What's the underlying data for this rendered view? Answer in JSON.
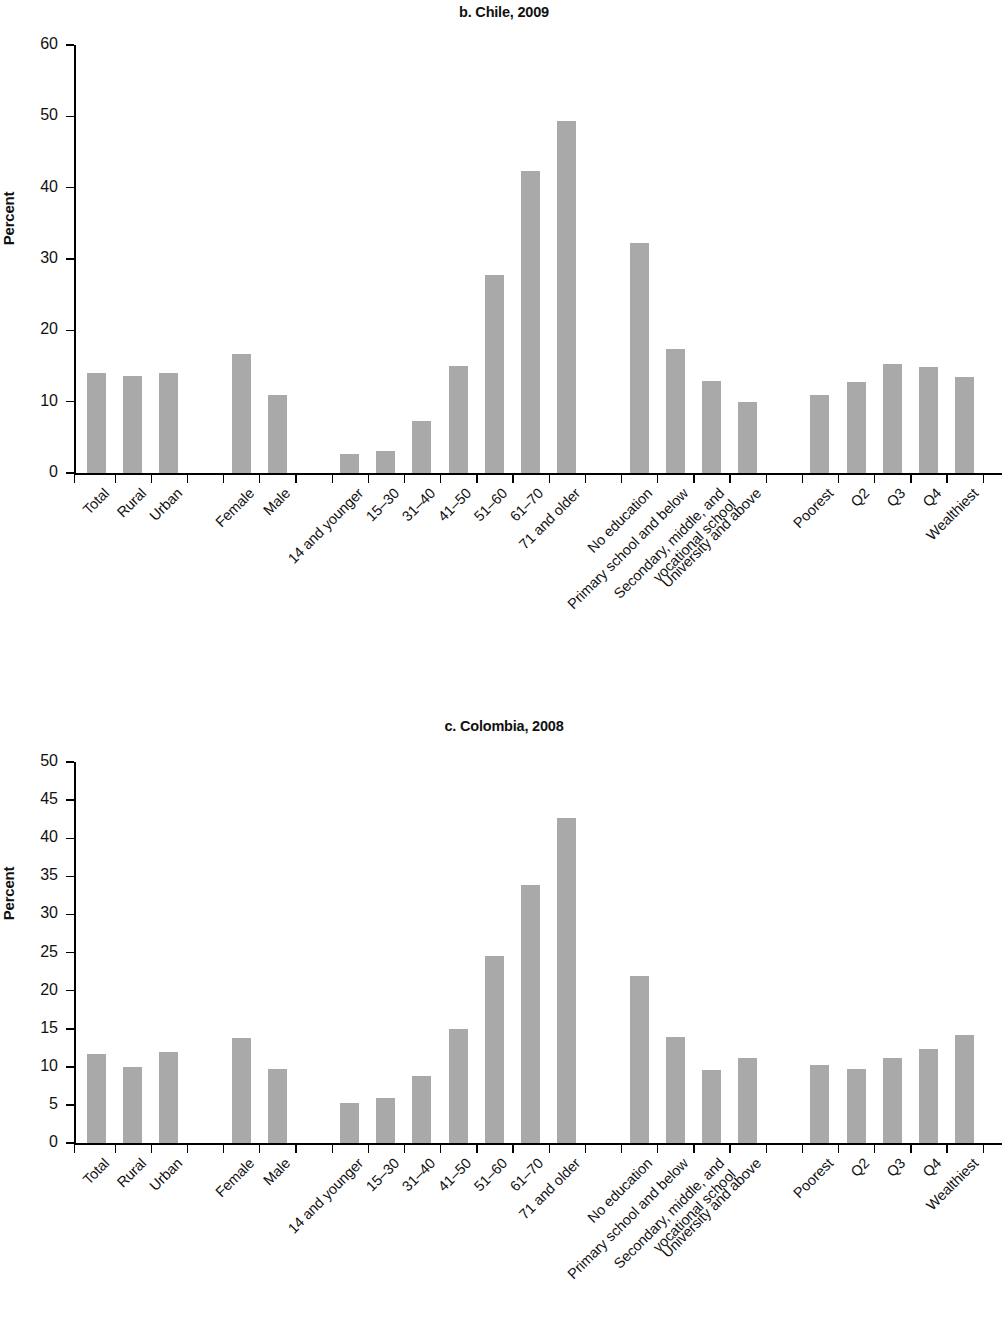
{
  "figure": {
    "ylabel": "Percent",
    "bar_color": "#a9a9a9"
  },
  "chart_data": [
    {
      "type": "bar",
      "title": "b. Chile, 2009",
      "xlabel": "",
      "ylabel": "Percent",
      "ylim": [
        0,
        60
      ],
      "yticks": [
        0,
        10,
        20,
        30,
        40,
        50,
        60
      ],
      "grid": false,
      "legend": null,
      "categories": [
        "Total",
        "Rural",
        "Urban",
        "",
        "Female",
        "Male",
        "",
        "14 and younger",
        "15–30",
        "31–40",
        "41–50",
        "51–60",
        "61–70",
        "71 and older",
        "",
        "No education",
        "Primary school and below",
        "Secondary, middle, and vocational school",
        "University and above",
        "",
        "Poorest",
        "Q2",
        "Q3",
        "Q4",
        "Wealthiest"
      ],
      "values": [
        14.0,
        13.6,
        14.0,
        null,
        16.7,
        10.9,
        null,
        2.7,
        3.1,
        7.3,
        15.0,
        27.8,
        42.4,
        49.3,
        null,
        32.3,
        17.4,
        12.9,
        10.0,
        null,
        11.0,
        12.7,
        15.3,
        14.9,
        13.5
      ]
    },
    {
      "type": "bar",
      "title": "c. Colombia, 2008",
      "xlabel": "",
      "ylabel": "Percent",
      "ylim": [
        0,
        50
      ],
      "yticks": [
        0,
        5,
        10,
        15,
        20,
        25,
        30,
        35,
        40,
        45,
        50
      ],
      "grid": false,
      "legend": null,
      "categories": [
        "Total",
        "Rural",
        "Urban",
        "",
        "Female",
        "Male",
        "",
        "14 and younger",
        "15–30",
        "31–40",
        "41–50",
        "51–60",
        "61–70",
        "71 and older",
        "",
        "No education",
        "Primary school and below",
        "Secondary, middle, and vocational school",
        "University and above",
        "",
        "Poorest",
        "Q2",
        "Q3",
        "Q4",
        "Wealthiest"
      ],
      "values": [
        11.7,
        10.0,
        12.0,
        null,
        13.8,
        9.7,
        null,
        5.3,
        5.9,
        8.8,
        14.9,
        24.5,
        33.8,
        42.7,
        null,
        21.9,
        13.9,
        9.6,
        11.2,
        null,
        10.3,
        9.7,
        11.1,
        12.4,
        14.2
      ]
    }
  ]
}
